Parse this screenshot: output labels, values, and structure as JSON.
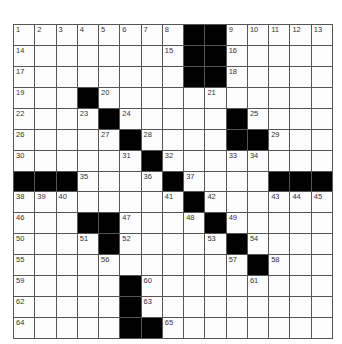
{
  "puzzle": {
    "rows": 15,
    "cols": 15,
    "colors": {
      "black": "#000000",
      "white": "#fdfdfd",
      "gridline": "#555555",
      "number": "#333333"
    },
    "grid": [
      [
        "1",
        "2",
        "3",
        "4",
        "5",
        "6",
        "7",
        "8",
        "#",
        "#",
        "9",
        "10",
        "11",
        "12",
        "13"
      ],
      [
        "14",
        "",
        "",
        "",
        "",
        "",
        "",
        "15",
        "#",
        "#",
        "16",
        "",
        "",
        "",
        ""
      ],
      [
        "17",
        "",
        "",
        "",
        "",
        "",
        "",
        "",
        "#",
        "#",
        "18",
        "",
        "",
        "",
        ""
      ],
      [
        "19",
        "",
        "",
        "#",
        "20",
        "",
        "",
        "",
        "",
        "21",
        "",
        "",
        "",
        "",
        ""
      ],
      [
        "22",
        "",
        "",
        "23",
        "#",
        "24",
        "",
        "",
        "",
        "",
        "#",
        "25",
        "",
        "",
        ""
      ],
      [
        "26",
        "",
        "",
        "",
        "27",
        "#",
        "28",
        "",
        "",
        "",
        "#",
        "#",
        "29",
        "",
        ""
      ],
      [
        "30",
        "",
        "",
        "",
        "",
        "31",
        "#",
        "32",
        "",
        "",
        "33",
        "34",
        "",
        "",
        ""
      ],
      [
        "#",
        "#",
        "#",
        "35",
        "",
        "",
        "36",
        "#",
        "37",
        "",
        "",
        "",
        "#",
        "#",
        "#"
      ],
      [
        "38",
        "39",
        "40",
        "",
        "",
        "",
        "",
        "41",
        "#",
        "42",
        "",
        "",
        "43",
        "44",
        "45"
      ],
      [
        "46",
        "",
        "",
        "#",
        "#",
        "47",
        "",
        "",
        "48",
        "#",
        "49",
        "",
        "",
        "",
        ""
      ],
      [
        "50",
        "",
        "",
        "51",
        "#",
        "52",
        "",
        "",
        "",
        "53",
        "#",
        "54",
        "",
        "",
        ""
      ],
      [
        "55",
        "",
        "",
        "",
        "56",
        "",
        "",
        "",
        "",
        "",
        "57",
        "#",
        "58",
        "",
        ""
      ],
      [
        "59",
        "",
        "",
        "",
        "",
        "#",
        "60",
        "",
        "",
        "",
        "",
        "61",
        "",
        "",
        ""
      ],
      [
        "62",
        "",
        "",
        "",
        "",
        "#",
        "63",
        "",
        "",
        "",
        "",
        "",
        "",
        "",
        ""
      ],
      [
        "64",
        "",
        "",
        "",
        "",
        "#",
        "#",
        "65",
        "",
        "",
        "",
        "",
        "",
        "",
        ""
      ]
    ]
  }
}
